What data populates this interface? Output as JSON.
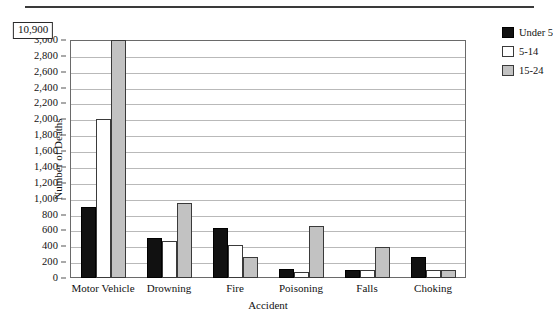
{
  "chart_data": {
    "type": "bar",
    "title": "",
    "xlabel": "Accident",
    "ylabel": "Number of Deaths",
    "ylim": [
      0,
      3000
    ],
    "ytick_step": 200,
    "ytick_labels": [
      "0",
      "200",
      "400",
      "600",
      "800",
      "1,000",
      "1,200",
      "1,400",
      "1,600",
      "1,800",
      "2,000",
      "2,200",
      "2,400",
      "2,600",
      "2,800",
      "3,000"
    ],
    "grid": true,
    "legend_position": "right",
    "categories": [
      "Motor Vehicle",
      "Drowning",
      "Fire",
      "Poisoning",
      "Falls",
      "Choking"
    ],
    "series": [
      {
        "name": "Under 5",
        "color": "#111111",
        "values": [
          900,
          500,
          630,
          110,
          105,
          265
        ]
      },
      {
        "name": "5-14",
        "color": "#ffffff",
        "values": [
          2000,
          465,
          410,
          80,
          95,
          95
        ]
      },
      {
        "name": "15-24",
        "color": "#c2c2c2",
        "values": [
          10900,
          950,
          270,
          650,
          385,
          100
        ]
      }
    ],
    "annotations": [
      {
        "text": "10,900",
        "category": "Motor Vehicle",
        "series": "15-24",
        "note": "value-callout-truncated-bar"
      }
    ]
  },
  "legend": {
    "items": [
      {
        "label": "Under 5"
      },
      {
        "label": "5-14"
      },
      {
        "label": "15-24"
      }
    ]
  }
}
